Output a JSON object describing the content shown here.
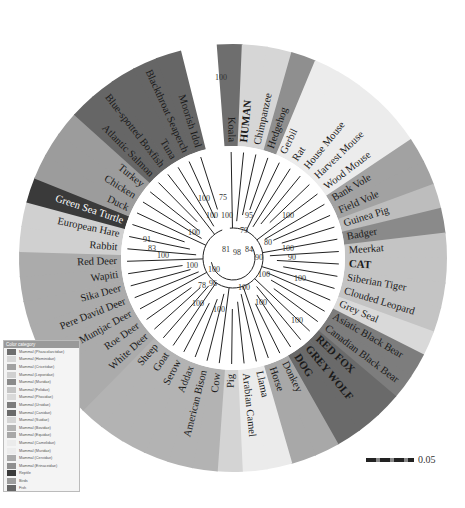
{
  "figure": {
    "center": [
      233,
      258
    ],
    "ring_inner": 112,
    "ring_outer": 214,
    "leaves": [
      {
        "label": "Koala",
        "cat": "Marsupial",
        "color": "#6e6e6e",
        "bold": false
      },
      {
        "label": "HUMAN",
        "cat": "Primates",
        "color": "#d6d6d6",
        "bold": true
      },
      {
        "label": "Chimpanzee",
        "cat": "Primates",
        "color": "#d6d6d6",
        "bold": false
      },
      {
        "label": "Hedgehog",
        "cat": "Eulipotyphla",
        "color": "#8f8f8f",
        "bold": false
      },
      {
        "label": "Gerbil",
        "cat": "Rodentia",
        "color": "#ececec",
        "bold": false
      },
      {
        "label": "Rat",
        "cat": "Rodentia",
        "color": "#ececec",
        "bold": false
      },
      {
        "label": "House Mouse",
        "cat": "Rodentia",
        "color": "#ececec",
        "bold": false
      },
      {
        "label": "Harvest Mouse",
        "cat": "Rodentia",
        "color": "#ececec",
        "bold": false
      },
      {
        "label": "Wood Mouse",
        "cat": "Rodentia",
        "color": "#ececec",
        "bold": false
      },
      {
        "label": "Bank Vole",
        "cat": "Rodentia",
        "color": "#a2a2a2",
        "bold": false
      },
      {
        "label": "Field Vole",
        "cat": "Rodentia",
        "color": "#a2a2a2",
        "bold": false
      },
      {
        "label": "Guinea Pig",
        "cat": "Rodentia",
        "color": "#bdbdbd",
        "bold": false
      },
      {
        "label": "Badger",
        "cat": "Carnivora",
        "color": "#8a8a8a",
        "bold": false
      },
      {
        "label": "Meerkat",
        "cat": "Carnivora",
        "color": "#c4c4c4",
        "bold": false
      },
      {
        "label": "CAT",
        "cat": "Carnivora",
        "color": "#c4c4c4",
        "bold": true
      },
      {
        "label": "Siberian Tiger",
        "cat": "Carnivora",
        "color": "#c4c4c4",
        "bold": false
      },
      {
        "label": "Clouded Leopard",
        "cat": "Carnivora",
        "color": "#c4c4c4",
        "bold": false
      },
      {
        "label": "Grey Seal",
        "cat": "Carnivora",
        "color": "#d9d9d9",
        "bold": false
      },
      {
        "label": "Asiatic Black Bear",
        "cat": "Carnivora",
        "color": "#7d7d7d",
        "bold": false
      },
      {
        "label": "Canadian Black Bear",
        "cat": "Carnivora",
        "color": "#7d7d7d",
        "bold": false
      },
      {
        "label": "RED FOX",
        "cat": "Carnivora",
        "color": "#6a6a6a",
        "bold": true
      },
      {
        "label": "GREY WOLF",
        "cat": "Carnivora",
        "color": "#6a6a6a",
        "bold": true
      },
      {
        "label": "DOG",
        "cat": "Carnivora",
        "color": "#6a6a6a",
        "bold": true
      },
      {
        "label": "Donkey",
        "cat": "Perissodactyla",
        "color": "#a8a8a8",
        "bold": false
      },
      {
        "label": "Horse",
        "cat": "Perissodactyla",
        "color": "#a8a8a8",
        "bold": false
      },
      {
        "label": "Llama",
        "cat": "Camelidae",
        "color": "#ebebeb",
        "bold": false
      },
      {
        "label": "Arabian Camel",
        "cat": "Camelidae",
        "color": "#ebebeb",
        "bold": false
      },
      {
        "label": "Pig",
        "cat": "Suidae",
        "color": "#d4d4d4",
        "bold": false
      },
      {
        "label": "Cow",
        "cat": "Bovidae",
        "color": "#b3b3b3",
        "bold": false
      },
      {
        "label": "American Bison",
        "cat": "Bovidae",
        "color": "#b3b3b3",
        "bold": false
      },
      {
        "label": "Addax",
        "cat": "Bovidae",
        "color": "#b3b3b3",
        "bold": false
      },
      {
        "label": "Serow",
        "cat": "Bovidae",
        "color": "#b3b3b3",
        "bold": false
      },
      {
        "label": "Goat",
        "cat": "Bovidae",
        "color": "#b3b3b3",
        "bold": false
      },
      {
        "label": "Sheep",
        "cat": "Bovidae",
        "color": "#b3b3b3",
        "bold": false
      },
      {
        "label": "White Deer",
        "cat": "Cervidae",
        "color": "#ababab",
        "bold": false
      },
      {
        "label": "Roe Deer",
        "cat": "Cervidae",
        "color": "#ababab",
        "bold": false
      },
      {
        "label": "Muntjac Deer",
        "cat": "Cervidae",
        "color": "#ababab",
        "bold": false
      },
      {
        "label": "Pere David Deer",
        "cat": "Cervidae",
        "color": "#ababab",
        "bold": false
      },
      {
        "label": "Sika Deer",
        "cat": "Cervidae",
        "color": "#ababab",
        "bold": false
      },
      {
        "label": "Wapiti",
        "cat": "Cervidae",
        "color": "#ababab",
        "bold": false
      },
      {
        "label": "Red Deer",
        "cat": "Cervidae",
        "color": "#ababab",
        "bold": false
      },
      {
        "label": "Rabbit",
        "cat": "Lagomorpha",
        "color": "#d0d0d0",
        "bold": false
      },
      {
        "label": "European Hare",
        "cat": "Lagomorpha",
        "color": "#d0d0d0",
        "bold": false
      },
      {
        "label": "Green Sea Turtle",
        "cat": "Reptile",
        "color": "#3a3a3a",
        "bold": false,
        "invert": true
      },
      {
        "label": "Duck",
        "cat": "Birds",
        "color": "#9c9c9c",
        "bold": false
      },
      {
        "label": "Chicken",
        "cat": "Birds",
        "color": "#9c9c9c",
        "bold": false
      },
      {
        "label": "Turkey",
        "cat": "Birds",
        "color": "#9c9c9c",
        "bold": false
      },
      {
        "label": "Atlantic Salmon",
        "cat": "Fish",
        "color": "#666666",
        "bold": false
      },
      {
        "label": "Blue-spotted Boxfish",
        "cat": "Fish",
        "color": "#666666",
        "bold": false
      },
      {
        "label": "Tuna",
        "cat": "Fish",
        "color": "#666666",
        "bold": false
      },
      {
        "label": "Blackthroat Seaperch",
        "cat": "Fish",
        "color": "#666666",
        "bold": false
      },
      {
        "label": "Moorish Idol",
        "cat": "Fish",
        "color": "#666666",
        "bold": false
      }
    ],
    "bootstrap": [
      {
        "v": "100",
        "x": 215,
        "y": 80
      },
      {
        "v": "75",
        "x": 219,
        "y": 200
      },
      {
        "v": "100",
        "x": 198,
        "y": 201
      },
      {
        "v": "100",
        "x": 206,
        "y": 218
      },
      {
        "v": "100",
        "x": 221,
        "y": 218
      },
      {
        "v": "95",
        "x": 245,
        "y": 218
      },
      {
        "v": "100",
        "x": 282,
        "y": 218
      },
      {
        "v": "100",
        "x": 188,
        "y": 235
      },
      {
        "v": "79",
        "x": 240,
        "y": 233
      },
      {
        "v": "81",
        "x": 222,
        "y": 252
      },
      {
        "v": "98",
        "x": 233,
        "y": 255
      },
      {
        "v": "84",
        "x": 245,
        "y": 252
      },
      {
        "v": "80",
        "x": 264,
        "y": 245
      },
      {
        "v": "100",
        "x": 282,
        "y": 251
      },
      {
        "v": "90",
        "x": 288,
        "y": 260
      },
      {
        "v": "90",
        "x": 255,
        "y": 260
      },
      {
        "v": "100",
        "x": 258,
        "y": 277
      },
      {
        "v": "100",
        "x": 294,
        "y": 281
      },
      {
        "v": "91",
        "x": 143,
        "y": 242
      },
      {
        "v": "83",
        "x": 148,
        "y": 251
      },
      {
        "v": "100",
        "x": 157,
        "y": 258
      },
      {
        "v": "100",
        "x": 186,
        "y": 268
      },
      {
        "v": "100",
        "x": 208,
        "y": 272
      },
      {
        "v": "78",
        "x": 198,
        "y": 288
      },
      {
        "v": "96",
        "x": 209,
        "y": 286
      },
      {
        "v": "100",
        "x": 238,
        "y": 290
      },
      {
        "v": "100",
        "x": 255,
        "y": 305
      },
      {
        "v": "100",
        "x": 213,
        "y": 312
      },
      {
        "v": "100",
        "x": 291,
        "y": 323
      },
      {
        "v": "100",
        "x": 192,
        "y": 306
      }
    ]
  },
  "legend": {
    "title": "Color category",
    "items": [
      {
        "label": "Mammal (Phascolarctidae)",
        "color": "#6e6e6e"
      },
      {
        "label": "Mammal (Hominidae)",
        "color": "#d6d6d6"
      },
      {
        "label": "Mammal (Cricetidae)",
        "color": "#a2a2a2"
      },
      {
        "label": "Mammal (Leporidae)",
        "color": "#d0d0d0"
      },
      {
        "label": "Mammal (Muridae)",
        "color": "#8a8a8a"
      },
      {
        "label": "Mammal (Felidae)",
        "color": "#c4c4c4"
      },
      {
        "label": "Mammal (Phocidae)",
        "color": "#d9d9d9"
      },
      {
        "label": "Mammal (Ursidae)",
        "color": "#7d7d7d"
      },
      {
        "label": "Mammal (Canidae)",
        "color": "#6a6a6a"
      },
      {
        "label": "Mammal (Suidae)",
        "color": "#d4d4d4"
      },
      {
        "label": "Mammal (Bovidae)",
        "color": "#b3b3b3"
      },
      {
        "label": "Mammal (Equidae)",
        "color": "#a8a8a8"
      },
      {
        "label": "Mammal (Camelidae)",
        "color": "#ebebeb"
      },
      {
        "label": "Mammal (Muridae)",
        "color": "#ececec"
      },
      {
        "label": "Mammal (Cervidae)",
        "color": "#ababab"
      },
      {
        "label": "Mammal (Erinaceidae)",
        "color": "#8f8f8f"
      },
      {
        "label": "Reptile",
        "color": "#3a3a3a"
      },
      {
        "label": "Birds",
        "color": "#9c9c9c"
      },
      {
        "label": "Fish",
        "color": "#666666"
      }
    ]
  },
  "scale_bar": {
    "value": "0.05"
  }
}
